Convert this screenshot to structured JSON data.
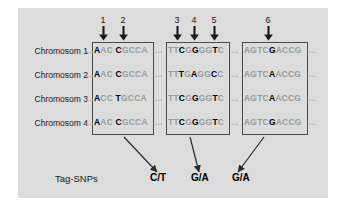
{
  "figure": {
    "panel_color": "#dcdcdc",
    "page_color": "#ffffff",
    "box_border_color": "#4a4a4a",
    "snp_base_color": "#000000",
    "flank_base_color": "#9a9a9a"
  },
  "snp_markers": [
    {
      "label": "1",
      "x": 103
    },
    {
      "label": "2",
      "x": 123
    },
    {
      "label": "3",
      "x": 177
    },
    {
      "label": "4",
      "x": 194
    },
    {
      "label": "5",
      "x": 214
    },
    {
      "label": "6",
      "x": 268
    }
  ],
  "row_labels": [
    "Chromosom 1",
    "Chromosom 2",
    "Chromosom 3",
    "Chromosom 4"
  ],
  "blocks": [
    {
      "name": "block-1",
      "x": 92,
      "y": 42,
      "width": 62,
      "height": 93,
      "rows": [
        [
          {
            "t": "A",
            "snp": true
          },
          {
            "t": "AC",
            "snp": false
          },
          {
            "t": " ",
            "snp": false
          },
          {
            "t": "C",
            "snp": true
          },
          {
            "t": "GCCA",
            "snp": false
          }
        ],
        [
          {
            "t": "A",
            "snp": true
          },
          {
            "t": "AC",
            "snp": false
          },
          {
            "t": " ",
            "snp": false
          },
          {
            "t": "C",
            "snp": true
          },
          {
            "t": "GCCA",
            "snp": false
          }
        ],
        [
          {
            "t": "A",
            "snp": true
          },
          {
            "t": "CC",
            "snp": false
          },
          {
            "t": " ",
            "snp": false
          },
          {
            "t": "T",
            "snp": true
          },
          {
            "t": "GCCA",
            "snp": false
          }
        ],
        [
          {
            "t": "A",
            "snp": true
          },
          {
            "t": "AC",
            "snp": false
          },
          {
            "t": " ",
            "snp": false
          },
          {
            "t": "C",
            "snp": true
          },
          {
            "t": "GCCA",
            "snp": false
          }
        ]
      ]
    },
    {
      "name": "block-2",
      "x": 166,
      "y": 42,
      "width": 64,
      "height": 93,
      "rows": [
        [
          {
            "t": "TT",
            "snp": false
          },
          {
            "t": "C",
            "snp": true
          },
          {
            "t": "G",
            "snp": false
          },
          {
            "t": "G",
            "snp": true
          },
          {
            "t": "GG",
            "snp": false
          },
          {
            "t": "T",
            "snp": true
          },
          {
            "t": "C",
            "snp": false
          }
        ],
        [
          {
            "t": "TT",
            "snp": false
          },
          {
            "t": "T",
            "snp": true
          },
          {
            "t": "G",
            "snp": false
          },
          {
            "t": "A",
            "snp": true
          },
          {
            "t": "GG",
            "snp": false
          },
          {
            "t": "C",
            "snp": true
          },
          {
            "t": "C",
            "snp": false
          }
        ],
        [
          {
            "t": "TT",
            "snp": false
          },
          {
            "t": "C",
            "snp": true
          },
          {
            "t": "G",
            "snp": false
          },
          {
            "t": "G",
            "snp": true
          },
          {
            "t": "GG",
            "snp": false
          },
          {
            "t": "T",
            "snp": true
          },
          {
            "t": "C",
            "snp": false
          }
        ],
        [
          {
            "t": "TT",
            "snp": false
          },
          {
            "t": "C",
            "snp": true
          },
          {
            "t": "G",
            "snp": false
          },
          {
            "t": "G",
            "snp": true
          },
          {
            "t": "GG",
            "snp": false
          },
          {
            "t": "T",
            "snp": true
          },
          {
            "t": "C",
            "snp": false
          }
        ]
      ]
    },
    {
      "name": "block-3",
      "x": 242,
      "y": 42,
      "width": 66,
      "height": 93,
      "rows": [
        [
          {
            "t": "AGTC",
            "snp": false
          },
          {
            "t": "G",
            "snp": true
          },
          {
            "t": "ACCG",
            "snp": false
          }
        ],
        [
          {
            "t": "AGTC",
            "snp": false
          },
          {
            "t": "A",
            "snp": true
          },
          {
            "t": "ACCG",
            "snp": false
          }
        ],
        [
          {
            "t": "AGTC",
            "snp": false
          },
          {
            "t": "A",
            "snp": true
          },
          {
            "t": "ACCG",
            "snp": false
          }
        ],
        [
          {
            "t": "AGTC",
            "snp": false
          },
          {
            "t": "G",
            "snp": true
          },
          {
            "t": "ACCG",
            "snp": false
          }
        ]
      ]
    }
  ],
  "ellipses": [
    {
      "name": "ellipsis-left-1",
      "x": 86,
      "y": 0,
      "text": "..."
    },
    {
      "name": "ellipsis-right-1",
      "x": 155,
      "y": 0,
      "text": "..."
    },
    {
      "name": "ellipsis-right-2",
      "x": 231,
      "y": 0,
      "text": "..."
    },
    {
      "name": "ellipsis-right-3",
      "x": 309,
      "y": 0,
      "text": "..."
    }
  ],
  "tag_snps": {
    "title": "Tag-SNPs",
    "values": [
      {
        "label": "C/T",
        "x": 150
      },
      {
        "label": "G/A",
        "x": 191
      },
      {
        "label": "G/A",
        "x": 232
      }
    ]
  },
  "connector_arrows": [
    {
      "name": "arrow-block1-to-tag1",
      "x1": 124,
      "y1": 137,
      "x2": 157,
      "y2": 172
    },
    {
      "name": "arrow-block2-to-tag2",
      "x1": 190,
      "y1": 137,
      "x2": 199,
      "y2": 172
    },
    {
      "name": "arrow-block3-to-tag3",
      "x1": 264,
      "y1": 137,
      "x2": 238,
      "y2": 172
    }
  ]
}
